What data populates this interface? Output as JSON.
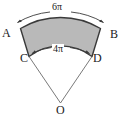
{
  "figure": {
    "kind": "annulus-sector-geometry-diagram",
    "fill_color": "#b9b9b9",
    "stroke_color": "#3a3a3a",
    "background_color": "#ffffff",
    "vertices": [
      {
        "id": "A",
        "label": "A",
        "role": "outer-arc-left-endpoint"
      },
      {
        "id": "B",
        "label": "B",
        "role": "outer-arc-right-endpoint"
      },
      {
        "id": "C",
        "label": "C",
        "role": "inner-arc-left-endpoint"
      },
      {
        "id": "D",
        "label": "D",
        "role": "inner-arc-right-endpoint"
      },
      {
        "id": "O",
        "label": "O",
        "role": "circle-center-apex"
      }
    ],
    "measurements": [
      {
        "id": "outer-arc",
        "label": "6π",
        "arc": "AB",
        "position": "above-outer-arc"
      },
      {
        "id": "inner-arc",
        "label": "4π",
        "arc": "CD",
        "position": "above-inner-arc"
      }
    ]
  }
}
